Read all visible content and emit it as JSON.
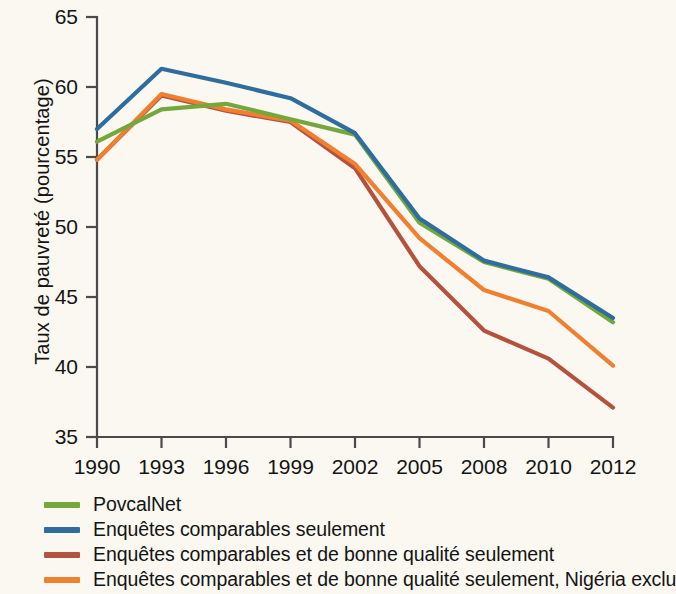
{
  "chart_data": {
    "type": "line",
    "title": "",
    "subtitle": "",
    "xlabel": "",
    "ylabel": "Taux de pauvreté (pourcentage)",
    "categories": [
      "1990",
      "1993",
      "1996",
      "1999",
      "2002",
      "2005",
      "2008",
      "2010",
      "2012"
    ],
    "x": [
      1990,
      1993,
      1996,
      1999,
      2002,
      2005,
      2008,
      2010,
      2012
    ],
    "ylim": [
      35,
      65
    ],
    "yticks": [
      35,
      40,
      45,
      50,
      55,
      60,
      65
    ],
    "ytick_labels": [
      "35",
      "40",
      "45",
      "50",
      "55",
      "60",
      "65"
    ],
    "grid": false,
    "legend_position": "below",
    "series": [
      {
        "name": "PovcalNet",
        "color": "#74a83c",
        "values": [
          56.1,
          58.4,
          58.8,
          57.7,
          56.6,
          50.3,
          47.5,
          46.3,
          43.2
        ]
      },
      {
        "name": "Enquêtes comparables seulement",
        "color": "#2e6d9e",
        "values": [
          57.0,
          61.3,
          60.3,
          59.2,
          56.7,
          50.6,
          47.6,
          46.4,
          43.5
        ]
      },
      {
        "name": "Enquêtes comparables et de bonne qualité seulement",
        "color": "#b5523e",
        "values": [
          54.8,
          59.4,
          58.3,
          57.5,
          54.2,
          47.2,
          42.6,
          40.6,
          37.1
        ]
      },
      {
        "name": "Enquêtes comparables et de bonne qualité seulement, Nigéria exclu",
        "color": "#f08030",
        "values": [
          54.8,
          59.5,
          58.4,
          57.6,
          54.5,
          49.2,
          45.5,
          44.0,
          40.1
        ]
      }
    ]
  },
  "axes": {
    "y_title": "Taux de pauvreté (pourcentage)",
    "y_ticks": [
      "65",
      "60",
      "55",
      "50",
      "45",
      "40",
      "35"
    ],
    "x_ticks": [
      "1990",
      "1993",
      "1996",
      "1999",
      "2002",
      "2005",
      "2008",
      "2010",
      "2012"
    ]
  },
  "legend": {
    "items": [
      {
        "label": "PovcalNet",
        "color": "#74a83c"
      },
      {
        "label": "Enquêtes comparables seulement",
        "color": "#2e6d9e"
      },
      {
        "label": "Enquêtes comparables et de bonne qualité seulement",
        "color": "#b5523e"
      },
      {
        "label": "Enquêtes comparables et de bonne qualité seulement, Nigéria exclu",
        "color": "#f08030"
      }
    ]
  }
}
